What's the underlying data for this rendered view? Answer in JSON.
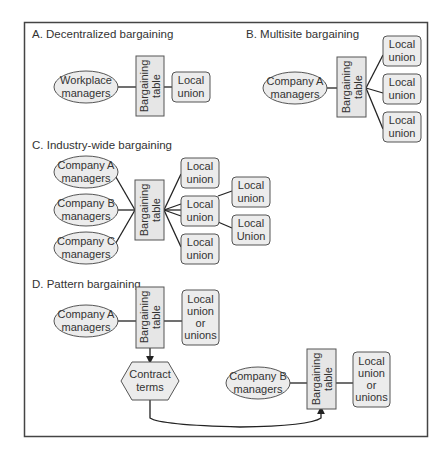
{
  "diagram": {
    "sections": {
      "A": {
        "title": "A. Decentralized bargaining",
        "managers": [
          "Workplace",
          "managers"
        ],
        "table": [
          "Bargaining",
          "table"
        ],
        "unions": [
          [
            "Local",
            "union"
          ]
        ]
      },
      "B": {
        "title": "B. Multisite bargaining",
        "managers": [
          "Company A",
          "managers"
        ],
        "table": [
          "Bargaining",
          "table"
        ],
        "unions": [
          [
            "Local",
            "union"
          ],
          [
            "Local",
            "union"
          ],
          [
            "Local",
            "union"
          ]
        ]
      },
      "C": {
        "title": "C. Industry-wide bargaining",
        "managers": [
          [
            "Company A",
            "managers"
          ],
          [
            "Company B",
            "managers"
          ],
          [
            "Company C",
            "managers"
          ]
        ],
        "table": [
          "Bargaining",
          "table"
        ],
        "unions": [
          [
            "Local",
            "union"
          ],
          [
            "Local",
            "union"
          ],
          [
            "Local",
            "union"
          ]
        ],
        "sub_unions": [
          [
            "Local",
            "union"
          ],
          [
            "Local",
            "Union"
          ]
        ]
      },
      "D": {
        "title": "D. Pattern bargaining",
        "managers_a": [
          "Company A",
          "managers"
        ],
        "table_a": [
          "Bargaining",
          "table"
        ],
        "union_a": [
          "Local",
          "union",
          "or",
          "unions"
        ],
        "contract": [
          "Contract",
          "terms"
        ],
        "managers_b": [
          "Company B",
          "managers"
        ],
        "table_b": [
          "Bargaining",
          "table"
        ],
        "union_b": [
          "Local",
          "union",
          "or",
          "unions"
        ]
      }
    }
  }
}
